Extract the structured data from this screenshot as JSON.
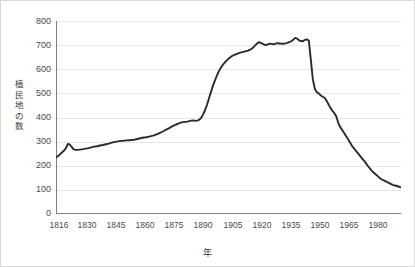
{
  "chart_data": {
    "type": "line",
    "title": "",
    "xlabel": "年",
    "ylabel": "植民地の数",
    "xlim": [
      1816,
      1992
    ],
    "ylim": [
      0,
      800
    ],
    "grid": true,
    "legend": false,
    "legend_position": "none",
    "line_color": "#2b2b2b",
    "grid_color": "#e6e6e6",
    "axis_color": "#808080",
    "yticks": [
      0,
      100,
      200,
      300,
      400,
      500,
      600,
      700,
      800
    ],
    "ytick_labels": [
      "0",
      "100",
      "200",
      "300",
      "400",
      "500",
      "600",
      "700",
      "800"
    ],
    "xticks": [
      1816,
      1830,
      1845,
      1860,
      1875,
      1890,
      1905,
      1920,
      1935,
      1950,
      1965,
      1980
    ],
    "xtick_labels": [
      "1816",
      "1830",
      "1845",
      "1860",
      "1875",
      "1890",
      "1905",
      "1920",
      "1935",
      "1950",
      "1965",
      "1980"
    ],
    "series": [
      {
        "name": "植民地の数",
        "x": [
          1816,
          1817,
          1818,
          1819,
          1820,
          1821,
          1822,
          1823,
          1824,
          1825,
          1826,
          1827,
          1828,
          1829,
          1830,
          1831,
          1832,
          1833,
          1834,
          1835,
          1836,
          1837,
          1838,
          1839,
          1840,
          1841,
          1842,
          1843,
          1844,
          1845,
          1846,
          1847,
          1848,
          1849,
          1850,
          1851,
          1852,
          1853,
          1854,
          1855,
          1856,
          1857,
          1858,
          1859,
          1860,
          1861,
          1862,
          1863,
          1864,
          1865,
          1866,
          1867,
          1868,
          1869,
          1870,
          1871,
          1872,
          1873,
          1874,
          1875,
          1876,
          1877,
          1878,
          1879,
          1880,
          1881,
          1882,
          1883,
          1884,
          1885,
          1886,
          1887,
          1888,
          1889,
          1890,
          1891,
          1892,
          1893,
          1894,
          1895,
          1896,
          1897,
          1898,
          1899,
          1900,
          1901,
          1902,
          1903,
          1904,
          1905,
          1906,
          1907,
          1908,
          1909,
          1910,
          1911,
          1912,
          1913,
          1914,
          1915,
          1916,
          1917,
          1918,
          1919,
          1920,
          1921,
          1922,
          1923,
          1924,
          1925,
          1926,
          1927,
          1928,
          1929,
          1930,
          1931,
          1932,
          1933,
          1934,
          1935,
          1936,
          1937,
          1938,
          1939,
          1940,
          1941,
          1942,
          1943,
          1944,
          1945,
          1946,
          1947,
          1948,
          1949,
          1950,
          1951,
          1952,
          1953,
          1954,
          1955,
          1956,
          1957,
          1958,
          1959,
          1960,
          1961,
          1962,
          1963,
          1964,
          1965,
          1966,
          1967,
          1968,
          1969,
          1970,
          1971,
          1972,
          1973,
          1974,
          1975,
          1976,
          1977,
          1978,
          1979,
          1980,
          1981,
          1982,
          1983,
          1984,
          1985,
          1986,
          1987,
          1988,
          1989,
          1990,
          1991,
          1992
        ],
        "values": [
          235,
          240,
          247,
          255,
          262,
          272,
          290,
          288,
          278,
          268,
          266,
          266,
          267,
          268,
          269,
          271,
          272,
          274,
          276,
          278,
          280,
          281,
          283,
          285,
          286,
          288,
          290,
          292,
          295,
          297,
          299,
          300,
          302,
          303,
          303,
          304,
          305,
          306,
          306,
          307,
          308,
          310,
          312,
          314,
          316,
          317,
          318,
          320,
          322,
          324,
          326,
          329,
          332,
          336,
          340,
          344,
          349,
          353,
          357,
          362,
          366,
          370,
          373,
          377,
          380,
          381,
          382,
          383,
          385,
          387,
          388,
          386,
          387,
          390,
          398,
          412,
          430,
          452,
          478,
          505,
          530,
          552,
          572,
          590,
          605,
          617,
          627,
          636,
          644,
          650,
          656,
          660,
          663,
          666,
          669,
          671,
          673,
          675,
          677,
          681,
          686,
          694,
          702,
          710,
          712,
          707,
          703,
          700,
          703,
          706,
          705,
          703,
          706,
          708,
          707,
          706,
          706,
          707,
          709,
          712,
          716,
          722,
          730,
          727,
          720,
          717,
          716,
          722,
          724,
          718,
          640,
          560,
          520,
          505,
          500,
          492,
          486,
          482,
          470,
          455,
          440,
          428,
          418,
          404,
          378,
          360,
          348,
          336,
          322,
          310,
          296,
          283,
          272,
          262,
          252,
          242,
          232,
          222,
          212,
          200,
          190,
          180,
          172,
          165,
          158,
          150,
          144,
          140,
          136,
          132,
          128,
          124,
          120,
          118,
          116,
          113,
          110
        ]
      }
    ]
  }
}
